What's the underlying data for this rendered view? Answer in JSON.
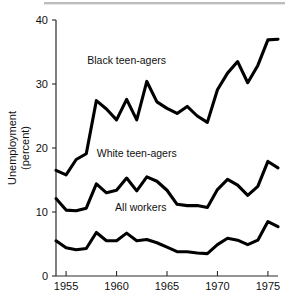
{
  "chart_data": {
    "type": "line",
    "title": "",
    "subtitle": "",
    "xlabel": "",
    "ylabel": "Unemployment (percent)",
    "ylabel_line1": "Unemployment",
    "ylabel_line2": "(percent)",
    "xlim": [
      1954,
      1976
    ],
    "ylim": [
      0,
      40
    ],
    "grid": false,
    "legend_position": "inline-annotations",
    "x_ticks": [
      1955,
      1960,
      1965,
      1970,
      1975
    ],
    "x_tick_labels": [
      "1955",
      "1960",
      "1965",
      "1970",
      "1975"
    ],
    "y_ticks": [
      0,
      10,
      20,
      30,
      40
    ],
    "y_tick_labels": [
      "0",
      "10",
      "20",
      "30",
      "40"
    ],
    "x": [
      1954,
      1955,
      1956,
      1957,
      1958,
      1959,
      1960,
      1961,
      1962,
      1963,
      1964,
      1965,
      1966,
      1967,
      1968,
      1969,
      1970,
      1971,
      1972,
      1973,
      1974,
      1975,
      1976
    ],
    "series": [
      {
        "name": "Black teen-agers",
        "color": "#000000",
        "values": [
          16.5,
          15.8,
          18.2,
          19.1,
          27.4,
          26.1,
          24.4,
          27.6,
          24.4,
          30.4,
          27.2,
          26.2,
          25.4,
          26.5,
          25.0,
          24.0,
          29.1,
          31.7,
          33.5,
          30.2,
          32.9,
          36.9,
          37.0
        ],
        "label_x": 1961.0,
        "label_y": 33.2
      },
      {
        "name": "White teen-agers",
        "color": "#000000",
        "values": [
          12.1,
          10.3,
          10.2,
          10.6,
          14.4,
          13.0,
          13.4,
          15.3,
          13.3,
          15.5,
          14.8,
          13.4,
          11.2,
          11.0,
          11.0,
          10.7,
          13.5,
          15.1,
          14.2,
          12.6,
          14.0,
          17.9,
          16.9
        ],
        "label_x": 1962.0,
        "label_y": 18.6
      },
      {
        "name": "All workers",
        "color": "#000000",
        "values": [
          5.5,
          4.4,
          4.1,
          4.3,
          6.8,
          5.5,
          5.5,
          6.7,
          5.5,
          5.7,
          5.2,
          4.5,
          3.8,
          3.8,
          3.6,
          3.5,
          4.9,
          5.9,
          5.6,
          4.9,
          5.6,
          8.5,
          7.7
        ],
        "label_x": 1962.4,
        "label_y": 10.2
      }
    ],
    "annotations": [
      {
        "text": "Black teen-agers",
        "x": 1961.0,
        "y": 33.2
      },
      {
        "text": "White teen-agers",
        "x": 1962.0,
        "y": 18.6
      },
      {
        "text": "All workers",
        "x": 1962.4,
        "y": 10.2
      }
    ]
  }
}
